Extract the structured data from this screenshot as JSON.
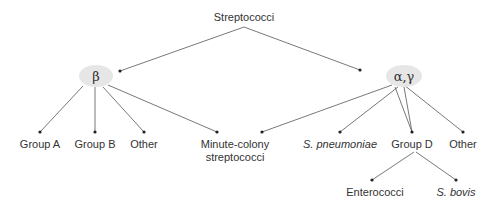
{
  "diagram": {
    "root": {
      "label": "Streptococci",
      "x": 244,
      "y": 12
    },
    "colors": {
      "line": "#555555",
      "node_fill": "#e6e6e6",
      "text": "#333333"
    },
    "groups": [
      {
        "id": "beta",
        "label": "β",
        "cx": 96,
        "cy": 76,
        "dot": [
          120,
          71
        ],
        "children": [
          {
            "label": "Group A",
            "italic": false,
            "x": 40
          },
          {
            "label": "Group B",
            "italic": false,
            "x": 95
          },
          {
            "label": "Other",
            "italic": false,
            "x": 144
          },
          {
            "label": "Minute-colony streptococci",
            "line1": "Minute-colony",
            "line2": "streptococci",
            "italic": false,
            "x": 217
          }
        ]
      },
      {
        "id": "alpha-gamma",
        "label": "α,γ",
        "cx": 404,
        "cy": 76,
        "dot": [
          360,
          70
        ],
        "children": [
          {
            "label": "S. pneumoniae",
            "italic": true,
            "x": 340
          },
          {
            "label": "Group D",
            "italic": false,
            "x": 412,
            "children": [
              {
                "label": "Enterococci",
                "italic": false,
                "x": 372
              },
              {
                "label": "S. bovis",
                "italic": true,
                "x": 456
              }
            ]
          },
          {
            "label": "Other",
            "italic": false,
            "x": 463
          }
        ]
      }
    ]
  }
}
